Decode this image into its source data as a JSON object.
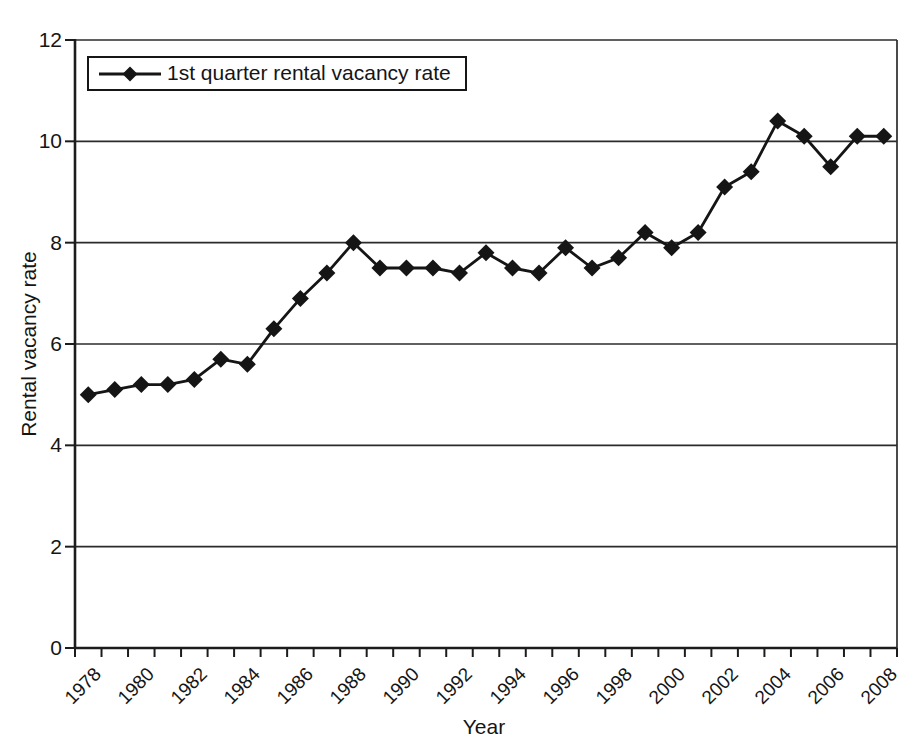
{
  "chart_data": {
    "type": "line",
    "title": "",
    "xlabel": "Year",
    "ylabel": "Rental vacancy rate",
    "ylim": [
      0,
      12
    ],
    "yticks": [
      0,
      2,
      4,
      6,
      8,
      10,
      12
    ],
    "x_label_every_years": 2,
    "grid": "horizontal",
    "legend_position": "top-left",
    "background": "#ffffff",
    "axis_color": "#1c1c1c",
    "series": [
      {
        "name": "1st quarter rental vacancy rate",
        "color": "#151515",
        "marker": "diamond",
        "x": [
          1978,
          1979,
          1980,
          1981,
          1982,
          1983,
          1984,
          1985,
          1986,
          1987,
          1988,
          1989,
          1990,
          1991,
          1992,
          1993,
          1994,
          1995,
          1996,
          1997,
          1998,
          1999,
          2000,
          2001,
          2002,
          2003,
          2004,
          2005,
          2006,
          2007,
          2008
        ],
        "values": [
          5.0,
          5.1,
          5.2,
          5.2,
          5.3,
          5.7,
          5.6,
          6.3,
          6.9,
          7.4,
          8.0,
          7.5,
          7.5,
          7.5,
          7.4,
          7.8,
          7.5,
          7.4,
          7.9,
          7.5,
          7.7,
          8.2,
          7.9,
          8.2,
          9.1,
          9.4,
          10.4,
          10.1,
          9.5,
          10.1,
          10.1
        ]
      }
    ]
  }
}
